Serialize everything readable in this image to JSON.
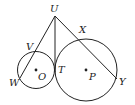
{
  "diagram": {
    "points": {
      "U": {
        "label": "U",
        "x": 55,
        "y": 16
      },
      "V": {
        "label": "V",
        "x": 31,
        "y": 53
      },
      "W": {
        "label": "W",
        "x": 20,
        "y": 77
      },
      "T": {
        "label": "T",
        "x": 55,
        "y": 70
      },
      "X": {
        "label": "X",
        "x": 80,
        "y": 39
      },
      "Y": {
        "label": "Y",
        "x": 116,
        "y": 78
      },
      "O": {
        "label": "O",
        "x": 36,
        "y": 70
      },
      "P": {
        "label": "P",
        "x": 86,
        "y": 70
      }
    },
    "circles": [
      {
        "name": "O",
        "cx": 36,
        "cy": 70,
        "r": 18.5
      },
      {
        "name": "P",
        "cx": 86,
        "cy": 70,
        "r": 31
      }
    ],
    "segments": [
      {
        "from": "U",
        "to": "W"
      },
      {
        "from": "U",
        "to": "T"
      },
      {
        "from": "U",
        "to": "Y"
      }
    ],
    "colors": {
      "stroke": "#222222",
      "background": "#ffffff"
    }
  }
}
